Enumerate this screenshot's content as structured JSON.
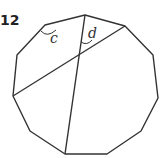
{
  "figure": {
    "label": "12",
    "shape": "hendecagon",
    "stroke_color": "#333333",
    "vertices": [
      [
        85,
        15
      ],
      [
        125,
        26
      ],
      [
        153,
        55
      ],
      [
        158,
        98
      ],
      [
        141,
        131
      ],
      [
        107,
        154
      ],
      [
        65,
        154
      ],
      [
        30,
        131
      ],
      [
        13,
        96
      ],
      [
        17,
        55
      ],
      [
        45,
        25
      ]
    ],
    "diagonals": [
      {
        "from": [
          85,
          15
        ],
        "to": [
          65,
          154
        ]
      },
      {
        "from": [
          125,
          26
        ],
        "to": [
          13,
          96
        ]
      }
    ],
    "angles": [
      {
        "label": "c",
        "x": 50,
        "y": 43
      },
      {
        "label": "d",
        "x": 88,
        "y": 38
      }
    ]
  }
}
